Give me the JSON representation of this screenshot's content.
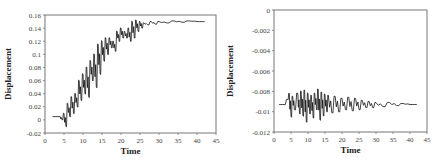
{
  "chart_data": [
    {
      "type": "line",
      "title": "",
      "xlabel": "Time",
      "ylabel": "Displacement",
      "xlim": [
        0,
        45
      ],
      "ylim": [
        -0.02,
        0.16
      ],
      "xticks": [
        "0",
        "5",
        "10",
        "15",
        "20",
        "25",
        "30",
        "35",
        "40",
        "45"
      ],
      "yticks": [
        "-0.02",
        "0",
        "0.02",
        "0.04",
        "0.06",
        "0.08",
        "0.1",
        "0.12",
        "0.14",
        "0.16"
      ],
      "grid": false,
      "legend": null,
      "series": [
        {
          "name": "Displacement",
          "description": "Oscillating response ramping from ~0.005 at t=2 to plateau ~0.15 after t=30",
          "x": [
            2,
            4,
            4.5,
            5,
            5.5,
            6,
            6.5,
            7,
            7.5,
            8,
            8.5,
            9,
            9.5,
            10,
            10.5,
            11,
            11.5,
            12,
            12.5,
            13,
            13.5,
            14,
            14.5,
            15,
            15.5,
            16,
            16.5,
            17,
            17.5,
            18,
            18.5,
            19,
            19.5,
            20,
            20.5,
            21,
            21.5,
            22,
            22.5,
            23,
            23.5,
            24,
            24.5,
            25,
            25.5,
            26,
            27,
            28,
            29,
            30,
            32,
            34,
            36,
            38,
            40,
            42
          ],
          "values": [
            0.005,
            0.005,
            0.0,
            0.01,
            -0.01,
            0.025,
            0.005,
            0.035,
            0.01,
            0.04,
            0.02,
            0.06,
            0.03,
            0.07,
            0.04,
            0.08,
            0.035,
            0.09,
            0.06,
            0.1,
            0.05,
            0.115,
            0.07,
            0.12,
            0.09,
            0.125,
            0.1,
            0.125,
            0.11,
            0.12,
            0.105,
            0.135,
            0.12,
            0.14,
            0.125,
            0.135,
            0.125,
            0.14,
            0.12,
            0.15,
            0.125,
            0.152,
            0.135,
            0.15,
            0.14,
            0.148,
            0.145,
            0.15,
            0.146,
            0.15,
            0.148,
            0.151,
            0.149,
            0.151,
            0.15,
            0.15
          ]
        }
      ]
    },
    {
      "type": "line",
      "title": "",
      "xlabel": "Time",
      "ylabel": "Displacement",
      "xlim": [
        0,
        45
      ],
      "ylim": [
        -0.012,
        0
      ],
      "xticks": [
        "0",
        "5",
        "10",
        "15",
        "20",
        "25",
        "30",
        "35",
        "40",
        "45"
      ],
      "yticks": [
        "0",
        "-0.002",
        "-0.004",
        "-0.006",
        "-0.008",
        "-0.01",
        "-0.012"
      ],
      "grid": false,
      "legend": null,
      "series": [
        {
          "name": "Displacement",
          "description": "Oscillation around ~-0.0093 with largest amplitude between t=4 and t=16, decaying toward t=42",
          "x": [
            1.5,
            3,
            4,
            4.5,
            5,
            5.5,
            6,
            7,
            7.5,
            8,
            8.5,
            9,
            9.5,
            10,
            10.5,
            11,
            11.5,
            12,
            12.5,
            13,
            13.5,
            14,
            14.5,
            15,
            15.5,
            16,
            17,
            18,
            19,
            20,
            21,
            22,
            23,
            24,
            25,
            26,
            27,
            28,
            29,
            30,
            32,
            34,
            36,
            38,
            40,
            42
          ],
          "values": [
            -0.0093,
            -0.0093,
            -0.0088,
            -0.0082,
            -0.0105,
            -0.0085,
            -0.0098,
            -0.0082,
            -0.0102,
            -0.008,
            -0.0104,
            -0.0079,
            -0.011,
            -0.0082,
            -0.0102,
            -0.0084,
            -0.0106,
            -0.0082,
            -0.0098,
            -0.0078,
            -0.0108,
            -0.0081,
            -0.0104,
            -0.0083,
            -0.01,
            -0.0084,
            -0.0101,
            -0.0085,
            -0.01,
            -0.0087,
            -0.0098,
            -0.0086,
            -0.0099,
            -0.0087,
            -0.0098,
            -0.0089,
            -0.0096,
            -0.009,
            -0.0096,
            -0.0091,
            -0.0095,
            -0.0091,
            -0.0094,
            -0.0092,
            -0.0093,
            -0.0093
          ]
        }
      ]
    }
  ]
}
